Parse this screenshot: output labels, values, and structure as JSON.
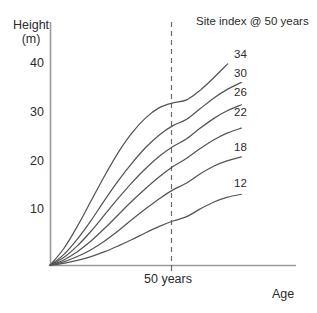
{
  "chart_data": {
    "type": "line",
    "title": "",
    "legend_title": "Site index @ 50 years",
    "legend_position": "top-right (inline curve end labels)",
    "xlabel": "Age",
    "ylabel": "Height (m)",
    "ylabel_line1": "Height",
    "ylabel_line2": "(m)",
    "grid": false,
    "xlim": [
      0,
      90
    ],
    "ylim": [
      0,
      50
    ],
    "x_ticks": [],
    "x_tick_labels": [],
    "y_ticks": [
      10,
      20,
      30,
      40
    ],
    "y_tick_labels": [
      "10",
      "20",
      "30",
      "40"
    ],
    "annotations": [
      {
        "name": "reference-line",
        "type": "vertical-dashed-line",
        "x": 50,
        "label": "50 years"
      }
    ],
    "series": [
      {
        "name": "34",
        "site_index_at_50": 34,
        "x": [
          0,
          5,
          10,
          15,
          20,
          25,
          30,
          35,
          40,
          45,
          50,
          55,
          60,
          65
        ],
        "values": [
          0,
          3.4,
          8.0,
          13.2,
          18.4,
          23.2,
          27.2,
          30.3,
          32.4,
          33.4,
          34.0,
          36.0,
          38.6,
          41.4
        ]
      },
      {
        "name": "30",
        "site_index_at_50": 30,
        "x": [
          0,
          5,
          10,
          15,
          20,
          25,
          30,
          35,
          40,
          45,
          50,
          55,
          60,
          65,
          70
        ],
        "values": [
          0,
          2.2,
          5.4,
          9.2,
          13.4,
          17.4,
          21.0,
          24.2,
          26.8,
          28.7,
          30.0,
          32.2,
          34.4,
          36.2,
          37.6
        ]
      },
      {
        "name": "26",
        "site_index_at_50": 26,
        "x": [
          0,
          5,
          10,
          15,
          20,
          25,
          30,
          35,
          40,
          45,
          50,
          55,
          60,
          65,
          70
        ],
        "values": [
          0,
          1.6,
          4.0,
          7.0,
          10.4,
          13.8,
          17.0,
          19.9,
          22.4,
          24.4,
          26.0,
          28.2,
          30.2,
          31.8,
          33.0
        ]
      },
      {
        "name": "22",
        "site_index_at_50": 22,
        "x": [
          0,
          5,
          10,
          15,
          20,
          25,
          30,
          35,
          40,
          45,
          50,
          55,
          60,
          65,
          70
        ],
        "values": [
          0,
          1.1,
          2.8,
          5.0,
          7.6,
          10.4,
          13.2,
          15.8,
          18.2,
          20.3,
          22.0,
          24.0,
          25.8,
          27.2,
          28.2
        ]
      },
      {
        "name": "18",
        "site_index_at_50": 18,
        "x": [
          0,
          5,
          10,
          15,
          20,
          25,
          30,
          35,
          40,
          45,
          50,
          55,
          60,
          65,
          70
        ],
        "values": [
          0,
          0.7,
          1.8,
          3.2,
          5.0,
          7.1,
          9.4,
          11.6,
          13.7,
          15.5,
          16.9,
          18.8,
          20.4,
          21.5,
          22.3
        ]
      },
      {
        "name": "12",
        "site_index_at_50": 12,
        "x": [
          0,
          5,
          10,
          15,
          20,
          25,
          30,
          35,
          40,
          45,
          50,
          55,
          60,
          65,
          70
        ],
        "values": [
          0,
          0.4,
          1.0,
          1.8,
          2.8,
          4.0,
          5.3,
          6.7,
          8.0,
          9.1,
          10.0,
          11.6,
          13.0,
          14.0,
          14.6
        ]
      }
    ],
    "colors": {
      "curve": "#555555",
      "axis": "#9a9a9a",
      "text": "#2b2b2b",
      "dash": "#6b6b6b",
      "background": "#ffffff"
    }
  }
}
